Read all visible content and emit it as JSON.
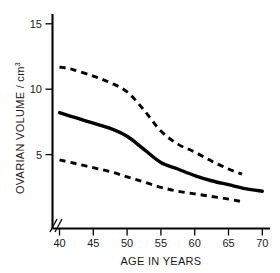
{
  "chart_data": {
    "type": "line",
    "title": "",
    "xlabel": "AGE IN YEARS",
    "ylabel": "OVARIAN VOLUME / cm",
    "ylabel_superscript": "3",
    "xlim": [
      40,
      70
    ],
    "ylim": [
      0,
      16
    ],
    "xticks": [
      40,
      45,
      50,
      55,
      60,
      65,
      70
    ],
    "yticks": [
      5,
      10,
      15
    ],
    "grid": false,
    "legend": "none",
    "axis_break": "//",
    "x": [
      40,
      45,
      50,
      55,
      60,
      65,
      70
    ],
    "series": [
      {
        "name": "Upper percentile",
        "style": "dashed",
        "x": [
          40,
          42,
          45,
          47.5,
          50,
          52.5,
          55,
          57.5,
          60,
          62.5,
          65,
          67
        ],
        "values": [
          11.7,
          11.5,
          11.0,
          10.5,
          9.8,
          8.4,
          6.8,
          5.8,
          5.2,
          4.5,
          3.9,
          3.5
        ]
      },
      {
        "name": "Median",
        "style": "solid",
        "x": [
          40,
          42.5,
          45,
          47.5,
          50,
          52.5,
          55,
          57.5,
          60,
          62.5,
          65,
          67.5,
          70
        ],
        "values": [
          8.2,
          7.8,
          7.4,
          7.0,
          6.4,
          5.4,
          4.4,
          3.9,
          3.4,
          3.0,
          2.7,
          2.4,
          2.2
        ]
      },
      {
        "name": "Lower percentile",
        "style": "dashed",
        "x": [
          40,
          42.5,
          45,
          47.5,
          50,
          52.5,
          55,
          57.5,
          60,
          62.5,
          65,
          67
        ],
        "values": [
          4.6,
          4.3,
          4.0,
          3.7,
          3.3,
          2.9,
          2.5,
          2.2,
          2.0,
          1.8,
          1.6,
          1.4
        ]
      }
    ]
  },
  "labels": {
    "y_15": "15",
    "y_10": "10",
    "y_5": "5",
    "x_40": "40",
    "x_45": "45",
    "x_50": "50",
    "x_55": "55",
    "x_60": "60",
    "x_65": "65",
    "x_70": "70",
    "x_axis_title": "AGE IN YEARS",
    "y_axis_title": "OVARIAN VOLUME / cm",
    "y_axis_superscript": "3"
  },
  "colors": {
    "ink": "#000000",
    "background": "#ffffff",
    "text": "#1a1a1a"
  }
}
